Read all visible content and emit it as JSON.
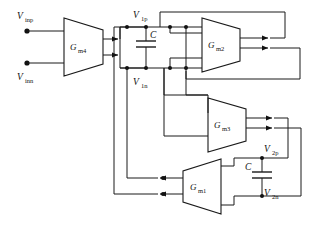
{
  "diagram": {
    "type": "circuit-schematic",
    "background_color": "#ffffff",
    "line_color": "#1a1a1a"
  },
  "terminals": [
    {
      "id": "vinp",
      "label_main": "V",
      "label_sub": "inp",
      "x": 22,
      "y": 31
    },
    {
      "id": "vinn",
      "label_main": "V",
      "label_sub": "inn",
      "x": 22,
      "y": 63
    }
  ],
  "blocks": [
    {
      "id": "gm4",
      "label_main": "G",
      "label_sub": "m4",
      "orientation": "right"
    },
    {
      "id": "gm2",
      "label_main": "G",
      "label_sub": "m2",
      "orientation": "right"
    },
    {
      "id": "gm3",
      "label_main": "G",
      "label_sub": "m3",
      "orientation": "right"
    },
    {
      "id": "gm1",
      "label_main": "G",
      "label_sub": "m1",
      "orientation": "left"
    }
  ],
  "nodes": [
    {
      "id": "v1p",
      "label_main": "V",
      "label_sub": "1p"
    },
    {
      "id": "v1n",
      "label_main": "V",
      "label_sub": "1n"
    },
    {
      "id": "v2p",
      "label_main": "V",
      "label_sub": "2p"
    },
    {
      "id": "v2n",
      "label_main": "V",
      "label_sub": "2n"
    }
  ],
  "capacitors": [
    {
      "id": "c1",
      "label": "C",
      "between": [
        "v1p",
        "v1n"
      ]
    },
    {
      "id": "c2",
      "label": "C",
      "between": [
        "v2p",
        "v2n"
      ]
    }
  ]
}
